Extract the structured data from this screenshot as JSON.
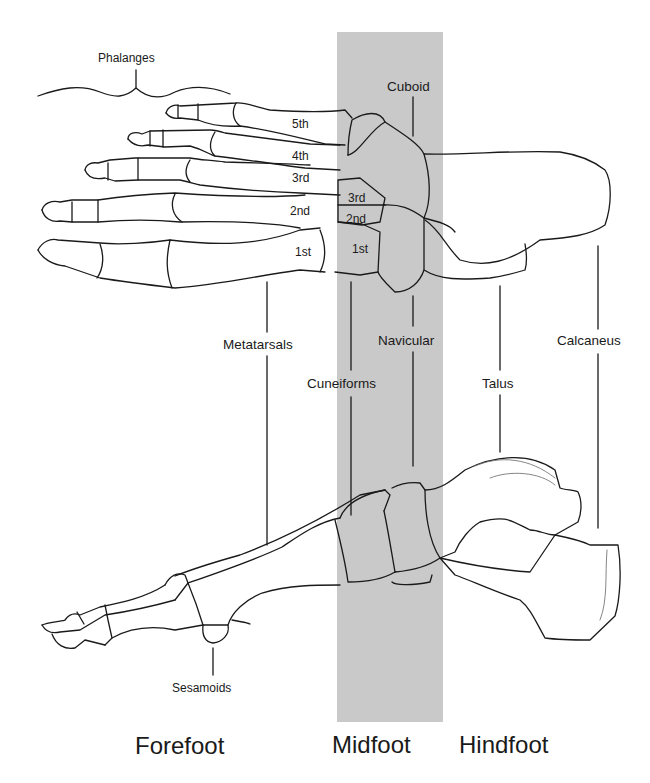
{
  "diagram": {
    "colors": {
      "midfoot_band": "#c9c9c9",
      "outline": "#1a1a1a",
      "background": "#ffffff"
    },
    "bone_labels": {
      "phalanges": "Phalanges",
      "cuboid": "Cuboid",
      "metatarsals": "Metatarsals",
      "navicular": "Navicular",
      "calcaneus": "Calcaneus",
      "cuneiforms": "Cuneiforms",
      "talus": "Talus",
      "sesamoids": "Sesamoids"
    },
    "metatarsal_numbers": [
      "5th",
      "4th",
      "3rd",
      "2nd",
      "1st"
    ],
    "cuneiform_numbers": [
      "3rd",
      "2nd",
      "1st"
    ],
    "regions": {
      "forefoot": "Forefoot",
      "midfoot": "Midfoot",
      "hindfoot": "Hindfoot"
    }
  }
}
